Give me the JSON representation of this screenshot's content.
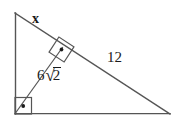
{
  "figure": {
    "type": "right-triangle-with-altitude",
    "background_color": "#ffffff",
    "stroke_color": "#555555",
    "text_color": "#1a1a1a",
    "width": 184,
    "height": 124,
    "vertices": {
      "top": [
        15,
        13
      ],
      "bottom_left": [
        15,
        114
      ],
      "bottom_right": [
        170,
        114
      ],
      "foot_of_altitude": [
        62,
        48
      ]
    },
    "segments": [
      {
        "name": "leg-vertical",
        "from": [
          15,
          13
        ],
        "to": [
          15,
          114
        ]
      },
      {
        "name": "leg-horizontal",
        "from": [
          15,
          114
        ],
        "to": [
          170,
          114
        ]
      },
      {
        "name": "hypotenuse",
        "from": [
          15,
          13
        ],
        "to": [
          170,
          114
        ]
      },
      {
        "name": "altitude",
        "from": [
          15,
          114
        ],
        "to": [
          62,
          48
        ]
      }
    ],
    "right_angle_markers": [
      {
        "name": "right-angle-at-foot",
        "center": [
          61,
          49
        ],
        "rotated": true
      },
      {
        "name": "right-angle-at-bottom-left",
        "center": [
          23,
          106
        ],
        "rotated": false
      }
    ]
  },
  "labels": {
    "unknown_side": "x",
    "hypotenuse_segment": "12",
    "altitude_value_coefficient": "6",
    "altitude_value_radicand": "2",
    "altitude_value_text": "6√2"
  }
}
